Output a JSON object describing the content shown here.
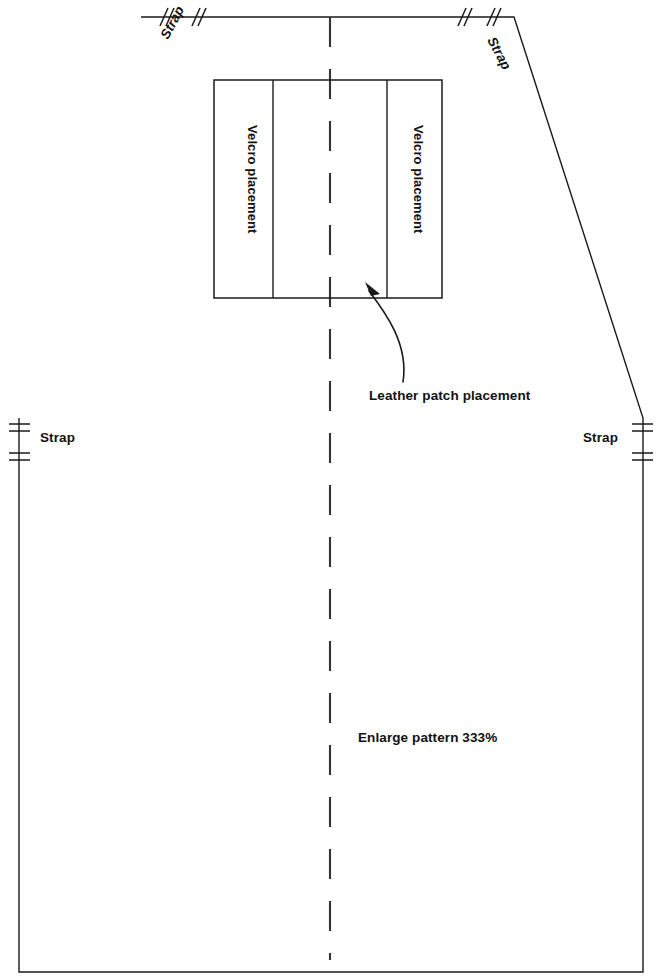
{
  "document": {
    "type": "sewing-pattern-diagram",
    "title": "Apron / bib pattern piece",
    "background_color": "#ffffff",
    "line_color": "#1a1a1a",
    "width": 663,
    "height": 980
  },
  "labels": {
    "strap_top_left": "Strap",
    "strap_top_right": "Strap",
    "strap_side_left": "Strap",
    "strap_side_right": "Strap",
    "velcro_left": "Velcro placement",
    "velcro_right": "Velcro placement",
    "leather_patch": "Leather patch placement",
    "enlarge_note": "Enlarge pattern 333%"
  },
  "geometry": {
    "outline_points": "141,17 514,17 643,418 643,972 19,972 19,418",
    "fold_line": {
      "x": 330,
      "y_start": 17,
      "y_end": 960,
      "dash": "30 22"
    },
    "velcro_box": {
      "x": 214,
      "y": 80,
      "width": 228,
      "height": 218
    },
    "velcro_inner_left_x": 273,
    "velcro_inner_right_x": 387,
    "leader": {
      "path": "M 401,381 C 405,345 383,315 370,292",
      "arrow_tip": "367,283"
    }
  },
  "notches": {
    "top_slashes": [
      {
        "x": 163,
        "y": 17
      },
      {
        "x": 195,
        "y": 17
      },
      {
        "x": 464,
        "y": 17
      },
      {
        "x": 492,
        "y": 17
      }
    ],
    "side_bars": [
      {
        "x": 19,
        "y": 427
      },
      {
        "x": 19,
        "y": 456
      },
      {
        "x": 643,
        "y": 427
      },
      {
        "x": 643,
        "y": 456
      }
    ]
  },
  "icon_names": {
    "notch_slash": "notch-slash-icon",
    "notch_bar": "notch-bar-icon",
    "fold": "fold-line-icon",
    "leader_arrow": "leader-arrow-icon"
  }
}
